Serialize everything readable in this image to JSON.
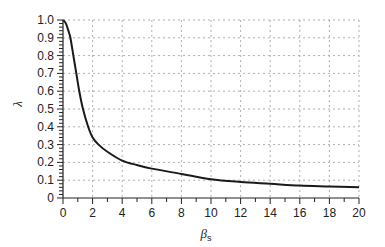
{
  "chart_data": {
    "type": "line",
    "title": "",
    "xlabel": "βs",
    "xlabel_main": "β",
    "xlabel_sub": "s",
    "ylabel": "λ",
    "xlim": [
      0,
      20
    ],
    "ylim": [
      0,
      1.0
    ],
    "xticks": [
      0,
      2,
      4,
      6,
      8,
      10,
      12,
      14,
      16,
      18,
      20
    ],
    "xtick_labels": [
      "0",
      "2",
      "4",
      "6",
      "8",
      "10",
      "12",
      "14",
      "16",
      "18",
      "20"
    ],
    "yticks": [
      0,
      0.1,
      0.2,
      0.3,
      0.4,
      0.5,
      0.6,
      0.7,
      0.8,
      0.9,
      1.0
    ],
    "ytick_labels": [
      "0",
      "0.1",
      "0.2",
      "0.3",
      "0.4",
      "0.5",
      "0.6",
      "0.7",
      "0.8",
      "0.9",
      "1.0"
    ],
    "grid": true,
    "grid_style": "dotted",
    "legend": null,
    "series": [
      {
        "name": "λ(βs)",
        "color": "#1a1a1a",
        "x": [
          0,
          0.2,
          0.4,
          0.5,
          0.7,
          0.9,
          1.1,
          1.35,
          1.7,
          2.0,
          2.4,
          3.0,
          4.0,
          5.0,
          6.0,
          8.0,
          10.0,
          12.0,
          14.0,
          16.0,
          18.0,
          20.0
        ],
        "y": [
          1.0,
          0.98,
          0.93,
          0.9,
          0.8,
          0.7,
          0.6,
          0.5,
          0.4,
          0.34,
          0.3,
          0.26,
          0.21,
          0.185,
          0.165,
          0.135,
          0.105,
          0.09,
          0.08,
          0.07,
          0.065,
          0.06
        ]
      }
    ]
  }
}
